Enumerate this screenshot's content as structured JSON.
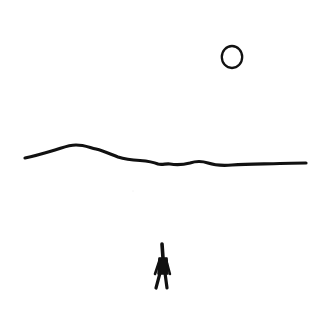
{
  "illustration": {
    "title": "Minimal ink drawing: figure walking beneath a horizon and sun",
    "background": "#ffffff",
    "ink": "#111111",
    "elements": [
      {
        "name": "sun",
        "shape": "circle",
        "cx": 232,
        "cy": 57,
        "r": 10.5
      },
      {
        "name": "horizon",
        "shape": "hand-drawn line"
      },
      {
        "name": "walking-figure",
        "shape": "stick figure"
      }
    ]
  }
}
